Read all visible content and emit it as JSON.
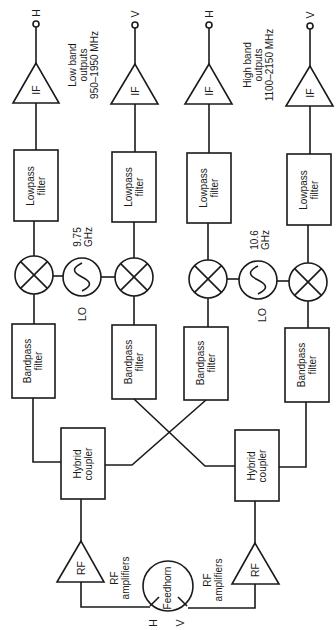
{
  "diagram": {
    "type": "block-diagram",
    "colors": {
      "line": "#1a1a1a",
      "background": "#ffffff"
    },
    "outputs": {
      "col1": "H",
      "col2": "V",
      "col3": "H",
      "col4": "V"
    },
    "output_groups": {
      "low": {
        "line1": "Low band",
        "line2": "outputs",
        "line3": "950–1950 MHz"
      },
      "high": {
        "line1": "High band",
        "line2": "outputs",
        "line3": "1100–2150 MHz"
      }
    },
    "if_amp_label": "IF",
    "lowpass": {
      "line1": "Lowpass",
      "line2": "filter"
    },
    "bandpass": {
      "line1": "Bandpass",
      "line2": "filter"
    },
    "lo1": {
      "freq_line1": "9.75",
      "freq_line2": "GHz",
      "label": "LO"
    },
    "lo2": {
      "freq_line1": "10.6",
      "freq_line2": "GHz",
      "label": "LO"
    },
    "hybrid": {
      "line1": "Hybrid",
      "line2": "coupler"
    },
    "rf_amp_label": "RF",
    "rf_amplifiers_label": {
      "line1": "RF",
      "line2": "amplifiers"
    },
    "feedhorn": {
      "label": "Feedhorn",
      "port_h": "H",
      "port_v": "V"
    }
  }
}
